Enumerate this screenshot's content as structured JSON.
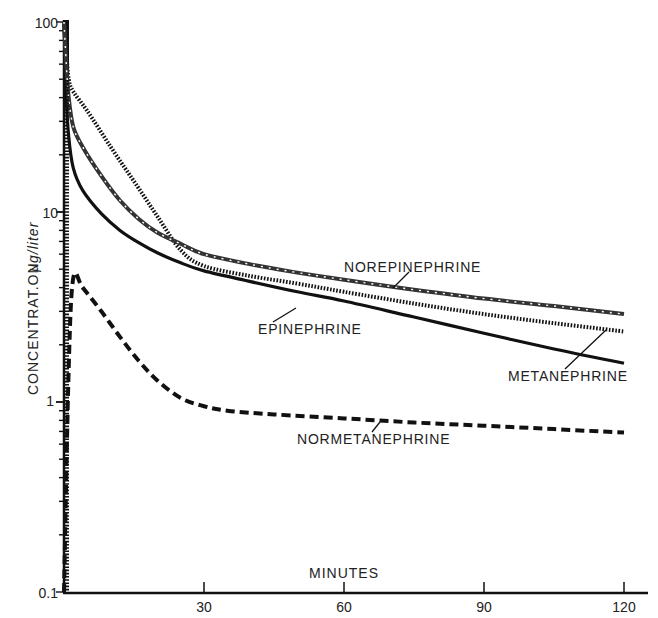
{
  "chart_data": {
    "type": "line",
    "title": "",
    "xlabel": "MINUTES",
    "ylabel": "CONCENTRAT.ON",
    "ylabel_units": "µg/liter",
    "yscale": "log",
    "xlim": [
      0,
      122
    ],
    "ylim": [
      0.1,
      100
    ],
    "grid": false,
    "legend": "inline labels with leader lines",
    "x_ticks": [
      30,
      60,
      90,
      120
    ],
    "x_tick_labels": [
      "30",
      "60",
      "90",
      "120"
    ],
    "y_tick_labels": [
      "0.1",
      "1",
      "10",
      "100"
    ],
    "y_ticks": [
      0.1,
      1,
      10,
      100
    ],
    "series": [
      {
        "name": "NOREPINEPHRINE",
        "style": "dash-dot hatched",
        "x": [
          0,
          0.5,
          1,
          2,
          4,
          8,
          12,
          16,
          20,
          25,
          30,
          40,
          50,
          60,
          75,
          90,
          105,
          120
        ],
        "values": [
          100,
          60,
          40,
          28,
          22,
          15.5,
          11.5,
          9.2,
          7.8,
          6.8,
          6.0,
          5.3,
          4.8,
          4.4,
          3.9,
          3.5,
          3.2,
          2.9
        ]
      },
      {
        "name": "EPINEPHRINE",
        "style": "dotted (checkered)",
        "x": [
          0,
          0.5,
          1,
          2,
          5,
          10,
          15,
          20,
          25,
          30,
          40,
          50,
          60,
          75,
          90,
          105,
          120
        ],
        "values": [
          100,
          70,
          50,
          43,
          34,
          22,
          14.5,
          9.5,
          6.3,
          5.2,
          4.6,
          4.2,
          3.8,
          3.3,
          2.9,
          2.6,
          2.35
        ]
      },
      {
        "name": "METANEPHRINE",
        "style": "solid",
        "x": [
          0,
          0.5,
          1,
          2,
          4,
          8,
          12,
          16,
          20,
          25,
          30,
          40,
          50,
          60,
          75,
          90,
          105,
          120
        ],
        "values": [
          100,
          40,
          25,
          17,
          13,
          9.8,
          8.0,
          6.9,
          6.1,
          5.4,
          4.9,
          4.3,
          3.8,
          3.4,
          2.8,
          2.3,
          1.9,
          1.6
        ]
      },
      {
        "name": "NORMETANEPHRINE",
        "style": "dashed",
        "x": [
          0,
          1,
          2,
          4,
          8,
          12,
          16,
          20,
          25,
          30,
          35,
          45,
          60,
          75,
          90,
          105,
          120
        ],
        "values": [
          0.1,
          1.5,
          4.5,
          4.0,
          3.0,
          2.2,
          1.65,
          1.3,
          1.05,
          0.95,
          0.9,
          0.86,
          0.82,
          0.78,
          0.75,
          0.72,
          0.69
        ]
      }
    ],
    "annotations": [
      {
        "text": "NOREPINEPHRINE",
        "x_px": 344,
        "y_px": 271
      },
      {
        "text": "EPINEPHRINE",
        "x_px": 258,
        "y_px": 332
      },
      {
        "text": "METANEPHRINE",
        "x_px": 508,
        "y_px": 380
      },
      {
        "text": "NORMETANEPHRINE",
        "x_px": 297,
        "y_px": 443
      }
    ]
  },
  "axes": {
    "y_label": "CONCENTRAT.ON",
    "y_units": "µg/liter",
    "x_label": "MINUTES",
    "y_ticks": {
      "t100": "100",
      "t10": "10",
      "t1": "1",
      "t01": "0.1"
    },
    "x_ticks": {
      "t30": "30",
      "t60": "60",
      "t90": "90",
      "t120": "120"
    }
  },
  "labels": {
    "norepinephrine": "NOREPINEPHRINE",
    "epinephrine": "EPINEPHRINE",
    "metanephrine": "METANEPHRINE",
    "normetanephrine": "NORMETANEPHRINE"
  },
  "colors": {
    "ink": "#111111",
    "background": "#ffffff"
  }
}
